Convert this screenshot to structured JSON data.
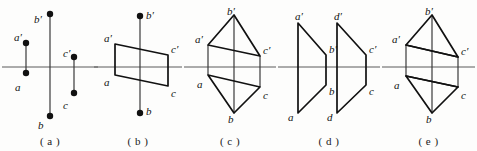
{
  "figure": {
    "width": 477,
    "height": 151,
    "background": "#fdfdfc",
    "ink": "#111111",
    "axis_color": "#5a5a5a"
  },
  "panels": [
    {
      "id": "a",
      "caption": "( a )",
      "left": 0,
      "width": 100,
      "axis_y": 67,
      "description": "three vertical segments crossing the horizontal axis, each endpoint marked with a filled dot",
      "axis": {
        "x1": 2,
        "x2": 98,
        "y": 67
      },
      "segments": [
        {
          "name": "a-prime-a",
          "x": 26,
          "y_top": 43,
          "y_bottom": 73
        },
        {
          "name": "b-prime-b",
          "x": 50,
          "y_top": 14,
          "y_bottom": 116
        },
        {
          "name": "c-prime-c",
          "x": 74,
          "y_top": 57,
          "y_bottom": 93
        }
      ],
      "labels": [
        {
          "name": "label-a-prime",
          "text": "a′",
          "x": 14,
          "y": 32
        },
        {
          "name": "label-a",
          "text": "a",
          "x": 15,
          "y": 82
        },
        {
          "name": "label-b-prime",
          "text": "b′",
          "x": 34,
          "y": 14
        },
        {
          "name": "label-b",
          "text": "b",
          "x": 38,
          "y": 120
        },
        {
          "name": "label-c-prime",
          "text": "c′",
          "x": 63,
          "y": 48
        },
        {
          "name": "label-c",
          "text": "c",
          "x": 63,
          "y": 100
        }
      ]
    },
    {
      "id": "b",
      "caption": "( b )",
      "left": 92,
      "width": 92,
      "axis_y": 67,
      "description": "a parallelogram a-prime c-prime c a straddling the axis, with a vertical b-prime b line through the middle",
      "axis": {
        "x1": 2,
        "x2": 90,
        "y": 67
      },
      "quad": [
        {
          "name": "a-prime",
          "x": 23,
          "y": 44
        },
        {
          "name": "c-prime",
          "x": 76,
          "y": 55
        },
        {
          "name": "c",
          "x": 76,
          "y": 86
        },
        {
          "name": "a",
          "x": 23,
          "y": 75
        }
      ],
      "segments": [
        {
          "name": "b-prime-b",
          "x": 48,
          "y_top": 16,
          "y_bottom": 113
        }
      ],
      "labels": [
        {
          "name": "label-a-prime",
          "text": "a′",
          "x": 12,
          "y": 33
        },
        {
          "name": "label-a",
          "text": "a",
          "x": 12,
          "y": 77
        },
        {
          "name": "label-b-prime",
          "text": "b′",
          "x": 54,
          "y": 10
        },
        {
          "name": "label-b",
          "text": "b",
          "x": 54,
          "y": 106
        },
        {
          "name": "label-c-prime",
          "text": "c′",
          "x": 79,
          "y": 44
        },
        {
          "name": "label-c",
          "text": "c",
          "x": 79,
          "y": 88
        }
      ]
    },
    {
      "id": "c",
      "caption": "( c )",
      "left": 182,
      "width": 96,
      "axis_y": 67,
      "description": "triangle a-prime b-prime c-prime above the axis mirrored by triangle a b c below, joined by three vertical lines",
      "axis": {
        "x1": 2,
        "x2": 94,
        "y": 67
      },
      "top_triangle": [
        {
          "name": "a-prime",
          "x": 26,
          "y": 45
        },
        {
          "name": "b-prime",
          "x": 52,
          "y": 15
        },
        {
          "name": "c-prime",
          "x": 78,
          "y": 56
        }
      ],
      "bottom_triangle": [
        {
          "name": "a",
          "x": 26,
          "y": 75
        },
        {
          "name": "b",
          "x": 52,
          "y": 113
        },
        {
          "name": "c",
          "x": 78,
          "y": 87
        }
      ],
      "segments": [
        {
          "name": "a-prime-a",
          "x": 26,
          "y_top": 45,
          "y_bottom": 75
        },
        {
          "name": "b-prime-b",
          "x": 52,
          "y_top": 15,
          "y_bottom": 113
        },
        {
          "name": "c-prime-c",
          "x": 78,
          "y_top": 56,
          "y_bottom": 87
        }
      ],
      "labels": [
        {
          "name": "label-a-prime",
          "text": "a′",
          "x": 13,
          "y": 34
        },
        {
          "name": "label-a",
          "text": "a",
          "x": 15,
          "y": 79
        },
        {
          "name": "label-b-prime",
          "text": "b′",
          "x": 45,
          "y": 6
        },
        {
          "name": "label-b",
          "text": "b",
          "x": 46,
          "y": 114
        },
        {
          "name": "label-c-prime",
          "text": "c′",
          "x": 81,
          "y": 45
        },
        {
          "name": "label-c",
          "text": "c",
          "x": 81,
          "y": 90
        }
      ]
    },
    {
      "id": "d",
      "caption": "( d )",
      "left": 276,
      "width": 106,
      "axis_y": 67,
      "description": "two slanted parallelograms side by side; left one a-prime b-prime b a, right one d-prime c-prime c d, each with vertical sides",
      "axis": {
        "x1": 2,
        "x2": 104,
        "y": 67
      },
      "quads": [
        {
          "name": "quad-left",
          "points": [
            {
              "name": "a-prime",
              "x": 22,
              "y": 23
            },
            {
              "name": "b-prime",
              "x": 50,
              "y": 55
            },
            {
              "name": "b",
              "x": 50,
              "y": 85
            },
            {
              "name": "a",
              "x": 22,
              "y": 113
            }
          ]
        },
        {
          "name": "quad-right",
          "points": [
            {
              "name": "d-prime",
              "x": 61,
              "y": 23
            },
            {
              "name": "c-prime",
              "x": 90,
              "y": 55
            },
            {
              "name": "c",
              "x": 90,
              "y": 85
            },
            {
              "name": "d",
              "x": 61,
              "y": 113
            }
          ]
        }
      ],
      "labels": [
        {
          "name": "label-a-prime",
          "text": "a′",
          "x": 19,
          "y": 11
        },
        {
          "name": "label-a",
          "text": "a",
          "x": 12,
          "y": 112
        },
        {
          "name": "label-b-prime",
          "text": "b′",
          "x": 53,
          "y": 44
        },
        {
          "name": "label-b",
          "text": "b",
          "x": 53,
          "y": 86
        },
        {
          "name": "label-d-prime",
          "text": "d′",
          "x": 58,
          "y": 11
        },
        {
          "name": "label-d",
          "text": "d",
          "x": 51,
          "y": 112
        },
        {
          "name": "label-c-prime",
          "text": "c′",
          "x": 93,
          "y": 44
        },
        {
          "name": "label-c",
          "text": "c",
          "x": 93,
          "y": 86
        }
      ]
    },
    {
      "id": "e",
      "caption": "( e )",
      "left": 380,
      "width": 97,
      "axis_y": 67,
      "description": "triangle a-prime b-prime c-prime above with chord a-prime c-prime, mirrored by triangle a b c below with chord a c, joined by verticals",
      "axis": {
        "x1": 2,
        "x2": 95,
        "y": 67
      },
      "top_triangle": [
        {
          "name": "a-prime",
          "x": 26,
          "y": 45
        },
        {
          "name": "b-prime",
          "x": 52,
          "y": 15
        },
        {
          "name": "c-prime",
          "x": 78,
          "y": 57
        }
      ],
      "bottom_triangle": [
        {
          "name": "a",
          "x": 26,
          "y": 76
        },
        {
          "name": "b",
          "x": 52,
          "y": 113
        },
        {
          "name": "c",
          "x": 78,
          "y": 87
        }
      ],
      "chords": [
        {
          "name": "chord-a-prime-c-prime",
          "x1": 26,
          "y1": 45,
          "x2": 78,
          "y2": 57
        },
        {
          "name": "chord-a-c",
          "x1": 26,
          "y1": 76,
          "x2": 78,
          "y2": 87
        }
      ],
      "segments": [
        {
          "name": "a-prime-a",
          "x": 26,
          "y_top": 45,
          "y_bottom": 76
        },
        {
          "name": "b-prime-b",
          "x": 52,
          "y_top": 15,
          "y_bottom": 113
        },
        {
          "name": "c-prime-c",
          "x": 78,
          "y_top": 57,
          "y_bottom": 87
        }
      ],
      "labels": [
        {
          "name": "label-a-prime",
          "text": "a′",
          "x": 12,
          "y": 34
        },
        {
          "name": "label-a",
          "text": "a",
          "x": 14,
          "y": 80
        },
        {
          "name": "label-b-prime",
          "text": "b′",
          "x": 45,
          "y": 6
        },
        {
          "name": "label-b",
          "text": "b",
          "x": 46,
          "y": 114
        },
        {
          "name": "label-c-prime",
          "text": "c′",
          "x": 81,
          "y": 46
        },
        {
          "name": "label-c",
          "text": "c",
          "x": 81,
          "y": 90
        }
      ]
    }
  ]
}
